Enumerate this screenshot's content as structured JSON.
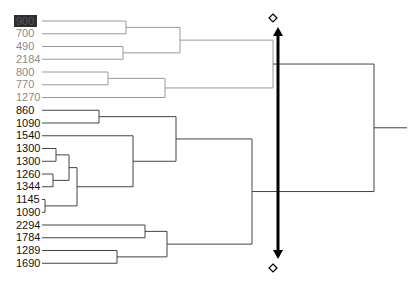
{
  "diagram": {
    "type": "dendrogram",
    "orientation": "leaves-left-root-right",
    "colors": {
      "gray_cluster": "#9a9a9a",
      "black_cluster": "#444444",
      "cut_arrow": "#000000",
      "highlight_bg": "#2e2e2e"
    },
    "row_start_y": 21,
    "row_spacing": 12.75,
    "leaf_line_start_x": 42,
    "leaves": [
      {
        "label": "900",
        "group": "gray",
        "highlighted": true
      },
      {
        "label": "700",
        "group": "gray"
      },
      {
        "label": "490",
        "group": "gray"
      },
      {
        "label": "2184",
        "group": "gray"
      },
      {
        "label": "800",
        "group": "gray"
      },
      {
        "label": "770",
        "group": "gray"
      },
      {
        "label": "1270",
        "group": "gray"
      },
      {
        "label": "860",
        "group": "black"
      },
      {
        "label": "1090",
        "group": "black"
      },
      {
        "label": "1540",
        "group": "black"
      },
      {
        "label": "1300",
        "group": "black"
      },
      {
        "label": "1300",
        "group": "black"
      },
      {
        "label": "1260",
        "group": "black"
      },
      {
        "label": "1344",
        "group": "black"
      },
      {
        "label": "1145",
        "group": "black"
      },
      {
        "label": "1090",
        "group": "black"
      },
      {
        "label": "2294",
        "group": "black"
      },
      {
        "label": "1784",
        "group": "black"
      },
      {
        "label": "1289",
        "group": "black"
      },
      {
        "label": "1690",
        "group": "black"
      }
    ],
    "merges": [
      {
        "id": "a",
        "children": [
          "L0",
          "L1"
        ],
        "x": 126,
        "group": "gray"
      },
      {
        "id": "b",
        "children": [
          "L2",
          "L3"
        ],
        "x": 123,
        "group": "gray"
      },
      {
        "id": "c",
        "children": [
          "a",
          "b"
        ],
        "x": 180,
        "group": "gray"
      },
      {
        "id": "d",
        "children": [
          "L4",
          "L5"
        ],
        "x": 108,
        "group": "gray"
      },
      {
        "id": "e",
        "children": [
          "d",
          "L6"
        ],
        "x": 165,
        "group": "gray"
      },
      {
        "id": "f",
        "children": [
          "c",
          "e"
        ],
        "x": 273,
        "group": "gray"
      },
      {
        "id": "g",
        "children": [
          "L7",
          "L8"
        ],
        "x": 99,
        "group": "black"
      },
      {
        "id": "h",
        "children": [
          "L10",
          "L11"
        ],
        "x": 56,
        "group": "black"
      },
      {
        "id": "i",
        "children": [
          "L12",
          "L13"
        ],
        "x": 53,
        "group": "black"
      },
      {
        "id": "j",
        "children": [
          "h",
          "i"
        ],
        "x": 69,
        "group": "black"
      },
      {
        "id": "k",
        "children": [
          "L14",
          "L15"
        ],
        "x": 45,
        "group": "black"
      },
      {
        "id": "l",
        "children": [
          "j",
          "k"
        ],
        "x": 77,
        "group": "black"
      },
      {
        "id": "m",
        "children": [
          "L9",
          "l"
        ],
        "x": 133,
        "group": "black"
      },
      {
        "id": "n",
        "children": [
          "g",
          "m"
        ],
        "x": 176,
        "group": "black"
      },
      {
        "id": "o",
        "children": [
          "L16",
          "L17"
        ],
        "x": 145,
        "group": "black"
      },
      {
        "id": "p",
        "children": [
          "L18",
          "L19"
        ],
        "x": 117,
        "group": "black"
      },
      {
        "id": "q",
        "children": [
          "o",
          "p"
        ],
        "x": 167,
        "group": "black"
      },
      {
        "id": "r",
        "children": [
          "n",
          "q"
        ],
        "x": 252,
        "group": "black"
      },
      {
        "id": "root",
        "children": [
          "f",
          "r"
        ],
        "x": 374,
        "group": "black",
        "stub_to_x": 407
      }
    ],
    "cut_line": {
      "x": 278,
      "y_top": 28,
      "y_bottom": 258,
      "top_handle_icon": "diamond-handle",
      "bottom_handle_icon": "diamond-handle",
      "top_handle_y": 18,
      "bottom_handle_y": 268
    }
  }
}
